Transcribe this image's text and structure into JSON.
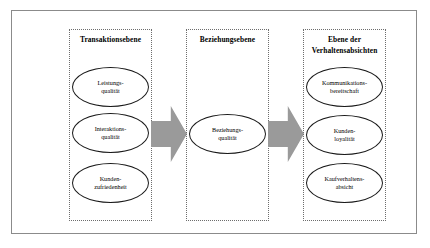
{
  "diagram": {
    "columns": [
      {
        "id": "transaktionsebene",
        "title": "Transaktionsebene",
        "nodes": [
          {
            "id": "leistungsqualitaet",
            "label": "Leistungs-\nqualität"
          },
          {
            "id": "interaktionsqualitaet",
            "label": "Interaktions-\nqualität"
          },
          {
            "id": "kundenzufriedenheit",
            "label": "Kunden-\nzufriedenheit"
          }
        ]
      },
      {
        "id": "beziehungsebene",
        "title": "Beziehungsebene",
        "nodes": [
          {
            "id": "beziehungsqualitaet",
            "label": "Beziehungs-\nqualität"
          }
        ]
      },
      {
        "id": "verhaltensabsichten",
        "title": "Ebene der\nVerhaltensabsichten",
        "nodes": [
          {
            "id": "kommunikationsbereitschaft",
            "label": "Kommunikations-\nbereitschaft"
          },
          {
            "id": "kundenloyalitaet",
            "label": "Kunden-\nloyalität"
          },
          {
            "id": "kaufverhaltensabsicht",
            "label": "Kaufverhaltens-\nabsicht"
          }
        ]
      }
    ],
    "arrows": [
      {
        "id": "transaktion-to-beziehung",
        "direction": "right"
      },
      {
        "id": "beziehung-to-verhalten",
        "direction": "right"
      }
    ],
    "colors": {
      "arrow_fill": "#9a9a9a",
      "frame_border": "#8b8b8b",
      "column_border": "#6d6d6d",
      "ellipse_border": "#1a1a1a",
      "background": "#ffffff",
      "text": "#000000"
    }
  }
}
